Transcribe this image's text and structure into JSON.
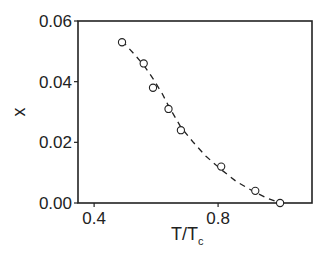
{
  "chart_data": {
    "type": "scatter",
    "title": "",
    "xlabel": "T/T",
    "xlabel_subscript": "c",
    "ylabel": "x",
    "xlim": [
      0.348,
      1.103
    ],
    "ylim": [
      0.0,
      0.06
    ],
    "xticks": [
      0.4,
      0.8
    ],
    "xtick_labels": [
      "0.4",
      "0.8"
    ],
    "yticks": [
      0.0,
      0.02,
      0.04,
      0.06
    ],
    "ytick_labels": [
      "0.00",
      "0.02",
      "0.04",
      "0.06"
    ],
    "grid": false,
    "legend": null,
    "series": [
      {
        "name": "data",
        "marker": "open-circle",
        "line": "none",
        "x": [
          0.49,
          0.56,
          0.59,
          0.64,
          0.68,
          0.81,
          0.92,
          1.0
        ],
        "y": [
          0.053,
          0.046,
          0.038,
          0.031,
          0.024,
          0.012,
          0.004,
          0.0
        ]
      },
      {
        "name": "fit",
        "marker": "none",
        "line": "dashed",
        "x": [
          0.49,
          0.53,
          0.56,
          0.59,
          0.62,
          0.64,
          0.68,
          0.72,
          0.76,
          0.81,
          0.86,
          0.92,
          0.96,
          1.0
        ],
        "y": [
          0.0535,
          0.049,
          0.0455,
          0.041,
          0.036,
          0.032,
          0.025,
          0.02,
          0.0155,
          0.011,
          0.007,
          0.0035,
          0.0015,
          0.0
        ]
      }
    ]
  },
  "colors": {
    "axis": "#222222",
    "marker": "#222222",
    "background": "#ffffff"
  }
}
